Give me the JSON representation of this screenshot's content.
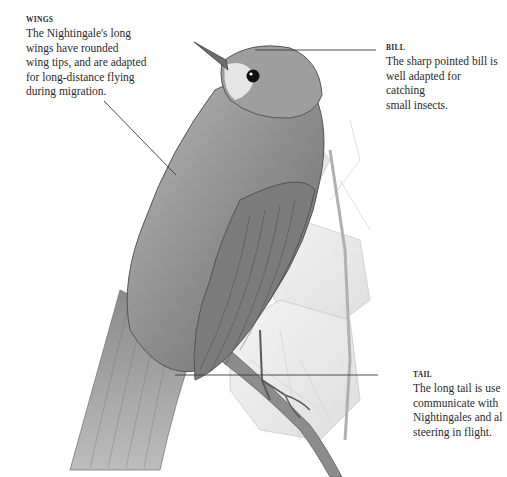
{
  "annotations": {
    "wings": {
      "heading": "WINGS",
      "lines": [
        "The Nightingale's long",
        "wings have rounded",
        "wing tips, and are adapted",
        "for long-distance flying",
        "during migration."
      ]
    },
    "bill": {
      "heading": "BILL",
      "lines": [
        "The sharp pointed bill is",
        "well adapted for catching",
        "small insects."
      ]
    },
    "tail": {
      "heading": "TAIL",
      "lines": [
        "The long tail is use",
        "communicate with",
        "Nightingales and al",
        "steering in flight."
      ]
    }
  },
  "illustration": {
    "subject": "Nightingale perched on branch",
    "style": "pencil drawing"
  }
}
